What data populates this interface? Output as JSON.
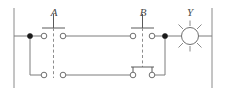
{
  "diagram": {
    "type": "electrical-ladder-circuit",
    "title": "",
    "colors": {
      "wire": "#7d7d7d",
      "rail": "#8a8a8a",
      "contact_outline": "#6f6f6f",
      "junction": "#1a1a1a",
      "dashed_link": "#8d8d8d",
      "label_text": "#4a4a4a",
      "background": "#ffffff"
    },
    "labels": {
      "switch_a": "A",
      "switch_b": "B",
      "lamp_y": "Y"
    },
    "rails": [
      {
        "name": "left-power-rail",
        "x": 14,
        "y1": 8,
        "y2": 88
      },
      {
        "name": "right-power-rail",
        "x": 212,
        "y1": 8,
        "y2": 88
      }
    ],
    "junctions": [
      {
        "name": "left-branch-junction",
        "cx": 30,
        "cy": 36,
        "r": 2.6
      },
      {
        "name": "right-branch-junction",
        "cx": 165,
        "cy": 36,
        "r": 2.6
      }
    ],
    "contacts": [
      {
        "name": "contact-a-upper-left",
        "cx": 44,
        "cy": 36,
        "r": 2.8
      },
      {
        "name": "contact-a-upper-right",
        "cx": 63,
        "cy": 36,
        "r": 2.8
      },
      {
        "name": "contact-a-lower-left",
        "cx": 44,
        "cy": 75,
        "r": 2.8
      },
      {
        "name": "contact-a-lower-right",
        "cx": 63,
        "cy": 75,
        "r": 2.8
      },
      {
        "name": "contact-b-upper-left",
        "cx": 133,
        "cy": 36,
        "r": 2.8
      },
      {
        "name": "contact-b-upper-right",
        "cx": 152,
        "cy": 36,
        "r": 2.8
      },
      {
        "name": "contact-b-lower-left",
        "cx": 133,
        "cy": 75,
        "r": 2.8
      },
      {
        "name": "contact-b-lower-right",
        "cx": 152,
        "cy": 75,
        "r": 2.8
      }
    ],
    "lamp": {
      "name": "lamp-y",
      "cx": 190,
      "cy": 36,
      "r": 8.5,
      "ray_count": 8
    }
  }
}
